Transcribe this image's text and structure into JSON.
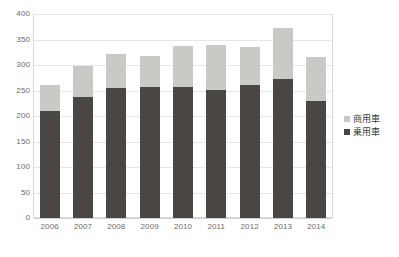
{
  "chart_data": {
    "type": "bar",
    "subtype": "stacked-vertical",
    "title": "",
    "xlabel": "",
    "ylabel": "",
    "categories": [
      "2006",
      "2007",
      "2008",
      "2009",
      "2010",
      "2011",
      "2012",
      "2013",
      "2014"
    ],
    "series": [
      {
        "name": "乗用車",
        "color": "#4a4643",
        "values": [
          209,
          238,
          254,
          256,
          257,
          251,
          261,
          273,
          230
        ]
      },
      {
        "name": "商用車",
        "color": "#c8cac5",
        "values": [
          51,
          60,
          67,
          62,
          81,
          89,
          74,
          100,
          85
        ]
      }
    ],
    "totals": [
      260,
      298,
      321,
      318,
      338,
      340,
      335,
      373,
      315
    ],
    "ylim": [
      0,
      400
    ],
    "yticks": [
      0,
      50,
      100,
      150,
      200,
      250,
      300,
      350,
      400
    ],
    "ytick_labels": [
      "0",
      "50",
      "100",
      "150",
      "200",
      "250",
      "300",
      "350",
      "400"
    ],
    "grid": true,
    "grid_axis": "y",
    "legend_position": "right"
  },
  "legend": {
    "items": [
      {
        "label": "商用車",
        "swatch_name": "legend-swatch-commercial"
      },
      {
        "label": "乗用車",
        "swatch_name": "legend-swatch-passenger"
      }
    ]
  },
  "colors": {
    "commercial": "#c8cac5",
    "passenger": "#4a4643",
    "gridline": "#e6e6e6",
    "frame": "#d9d9d9",
    "tick_text": "#6b6b6b",
    "legend_text": "#3d3d3d"
  }
}
